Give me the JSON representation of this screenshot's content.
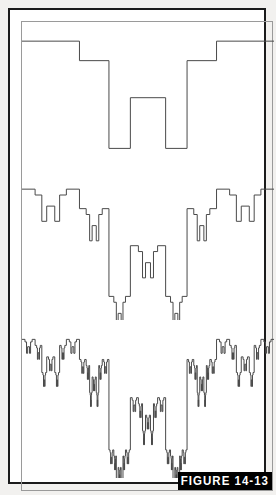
{
  "figure": {
    "label": "FIGURE 14-13",
    "banner_background": "#000000",
    "banner_text_color": "#ffffff",
    "frame_border_color": "#1b1b1b",
    "page_background": "#f2f1ef",
    "plot_background": "#ffffff",
    "trace_color": "#4a4a4a"
  },
  "chart_data": {
    "type": "line",
    "title": "FIGURE 14-13",
    "subtitle": "",
    "xlabel": "",
    "ylabel": "",
    "grid": false,
    "legend": null,
    "annotations": [
      "FIGURE 14-13"
    ],
    "panels": [
      {
        "name": "iteration-1",
        "order": 1,
        "recursion_depth": 0,
        "xlim": [
          0,
          1
        ],
        "ylim": [
          0,
          1
        ]
      },
      {
        "name": "iteration-2",
        "order": 2,
        "recursion_depth": 1,
        "xlim": [
          0,
          1
        ],
        "ylim": [
          0,
          1
        ]
      },
      {
        "name": "iteration-3",
        "order": 3,
        "recursion_depth": 2,
        "xlim": [
          0,
          1
        ],
        "ylim": [
          0,
          1
        ]
      }
    ],
    "base_generator": {
      "comment": "Normalized base waveform. x in [0,1] left-to-right, y in [0,1] where 0 = top of trace band and 1 = bottom of trace band. Piecewise-constant levels joined by vertical risers.",
      "segments": [
        {
          "x0": 0.0,
          "x1": 0.228,
          "y": 0.055
        },
        {
          "x0": 0.228,
          "x1": 0.345,
          "y": 0.205
        },
        {
          "x0": 0.345,
          "x1": 0.43,
          "y": 0.88
        },
        {
          "x0": 0.43,
          "x1": 0.57,
          "y": 0.49
        },
        {
          "x0": 0.57,
          "x1": 0.655,
          "y": 0.88
        },
        {
          "x0": 0.655,
          "x1": 0.772,
          "y": 0.205
        },
        {
          "x0": 0.772,
          "x1": 1.0,
          "y": 0.055
        }
      ],
      "levels": [
        0.055,
        0.205,
        0.49,
        0.88
      ],
      "symmetry": "mirror about x = 0.5"
    }
  }
}
